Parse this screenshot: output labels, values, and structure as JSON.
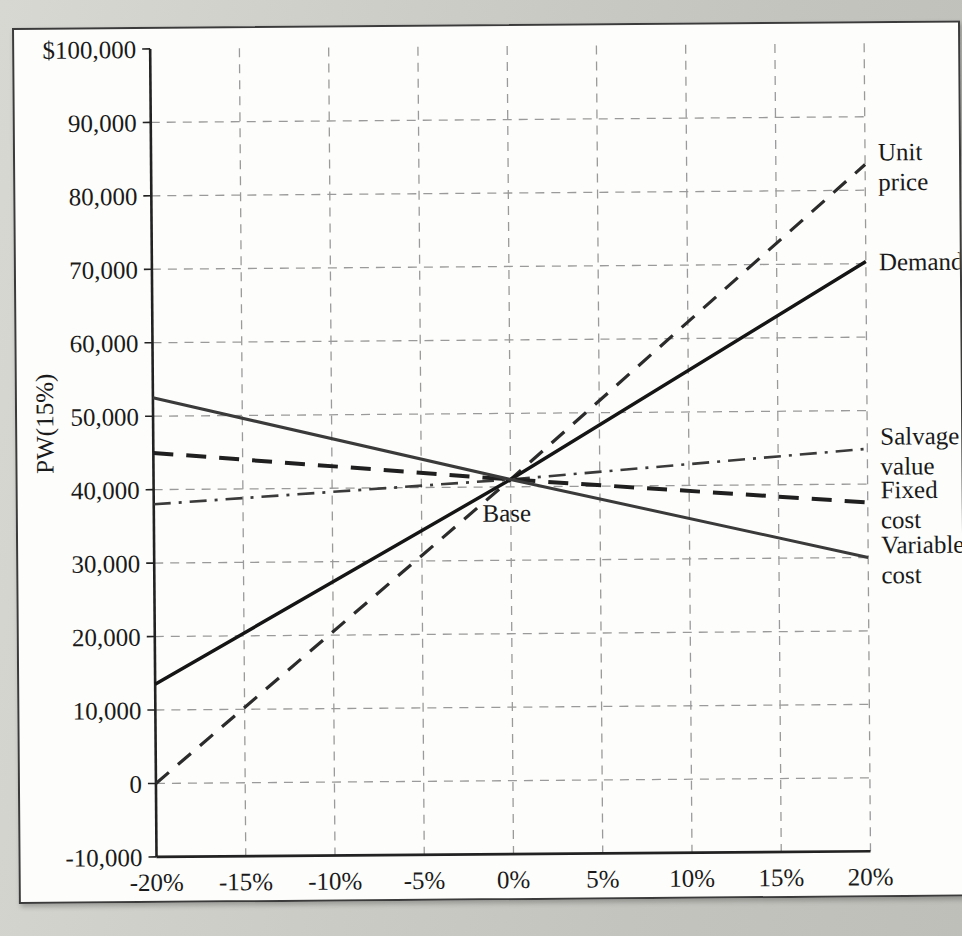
{
  "figure": {
    "background_color": "#fdfdfb",
    "page_color": "#c9c9c4",
    "border_color": "#3b3b3b"
  },
  "chart_data": {
    "type": "line",
    "title": "",
    "subtitle": "",
    "xlabel": "Deviation",
    "ylabel": "PW(15%)",
    "xlim": [
      -20,
      20
    ],
    "ylim": [
      -10000,
      100000
    ],
    "grid": true,
    "legend_position": "right-inline-labels",
    "x_tick_labels": [
      "-20%",
      "-15%",
      "-10%",
      "-5%",
      "0%",
      "5%",
      "10%",
      "15%",
      "20%"
    ],
    "x_tick_values": [
      -20,
      -15,
      -10,
      -5,
      0,
      5,
      10,
      15,
      20
    ],
    "y_tick_labels": [
      "$100,000",
      "90,000",
      "80,000",
      "70,000",
      "60,000",
      "50,000",
      "40,000",
      "30,000",
      "20,000",
      "10,000",
      "0",
      "-10,000"
    ],
    "y_tick_values": [
      100000,
      90000,
      80000,
      70000,
      60000,
      50000,
      40000,
      30000,
      20000,
      10000,
      0,
      -10000
    ],
    "base_point": {
      "x": 0,
      "y": 41000,
      "label": "Base"
    },
    "series": [
      {
        "name": "Unit price",
        "label": "Unit\nprice",
        "style": "dashed",
        "color": "#2b2b2b",
        "width": 3.2,
        "x": [
          -20,
          0,
          20
        ],
        "values": [
          0,
          41000,
          83500
        ]
      },
      {
        "name": "Demand",
        "label": "Demand",
        "style": "solid",
        "color": "#151515",
        "width": 3.4,
        "x": [
          -20,
          0,
          20
        ],
        "values": [
          13500,
          41000,
          70300
        ]
      },
      {
        "name": "Salvage value",
        "label": "Salvage\nvalue",
        "style": "dashdot",
        "color": "#3a3a3a",
        "width": 2.6,
        "x": [
          -20,
          0,
          20
        ],
        "values": [
          38000,
          41000,
          44800
        ]
      },
      {
        "name": "Fixed cost",
        "label": "Fixed\ncost",
        "style": "dashed",
        "color": "#1f1f1f",
        "width": 4.0,
        "x": [
          -20,
          0,
          20
        ],
        "values": [
          45000,
          41000,
          37500
        ]
      },
      {
        "name": "Variable cost",
        "label": "Variable\ncost",
        "style": "solid",
        "color": "#3a3a3a",
        "width": 3.0,
        "x": [
          -20,
          0,
          20
        ],
        "values": [
          52500,
          41000,
          30000
        ]
      }
    ]
  }
}
